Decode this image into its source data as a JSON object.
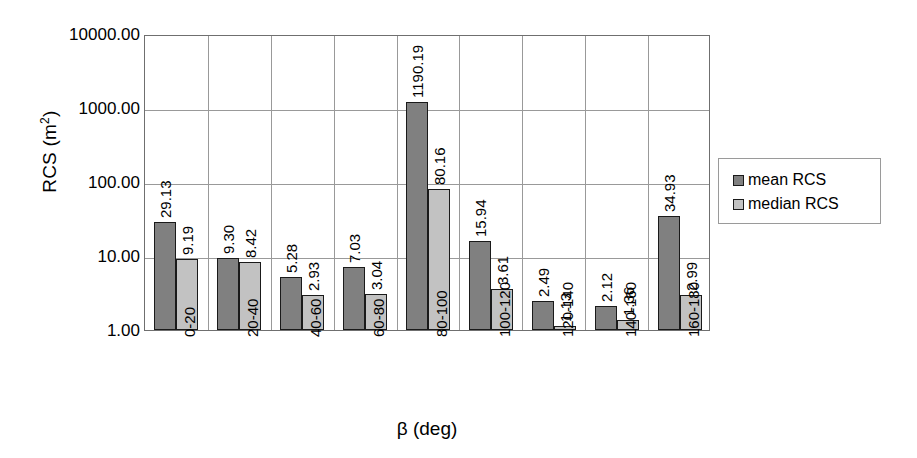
{
  "chart_data": {
    "type": "bar",
    "title": "",
    "xlabel": "β (deg)",
    "ylabel": "RCS (m²)",
    "yscale": "log",
    "ylim": [
      1,
      10000
    ],
    "ytick_labels": [
      "1.00",
      "10.00",
      "100.00",
      "1000.00",
      "10000.00"
    ],
    "ytick_values": [
      1,
      10,
      100,
      1000,
      10000
    ],
    "grid": true,
    "legend_position": "right",
    "categories": [
      "0-20",
      "20-40",
      "40-60",
      "60-80",
      "80-100",
      "100-120",
      "120-140",
      "140-160",
      "160-180"
    ],
    "series": [
      {
        "name": "mean RCS",
        "color": "#808080",
        "values": [
          29.13,
          9.3,
          5.28,
          7.03,
          1190.19,
          15.94,
          2.49,
          2.12,
          34.93
        ],
        "labels": [
          "29.13",
          "9.30",
          "5.28",
          "7.03",
          "1190.19",
          "15.94",
          "2.49",
          "2.12",
          "34.93"
        ]
      },
      {
        "name": "median RCS",
        "color": "#c2c2c2",
        "values": [
          9.19,
          8.42,
          2.93,
          3.04,
          80.16,
          3.61,
          1.13,
          1.36,
          2.99
        ],
        "labels": [
          "9.19",
          "8.42",
          "2.93",
          "3.04",
          "80.16",
          "3.61",
          "1.13",
          "1.36",
          "2.99"
        ]
      }
    ]
  },
  "legend": {
    "items": [
      {
        "label": "mean RCS",
        "color": "#808080"
      },
      {
        "label": "median RCS",
        "color": "#c2c2c2"
      }
    ]
  }
}
